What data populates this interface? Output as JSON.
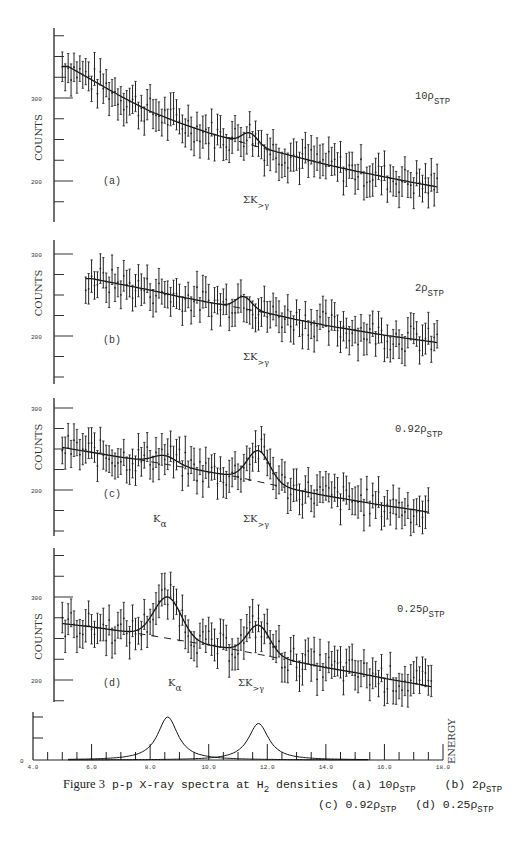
{
  "figure": {
    "caption_prefix": "Figure 3",
    "caption_title": "p-p X-ray spectra at H",
    "caption_h_sub": "2",
    "caption_rest": " densities",
    "legend_items": [
      {
        "label": "(a) 10ρ",
        "sub": "STP"
      },
      {
        "label": "(b) 2ρ",
        "sub": "STP"
      },
      {
        "label": "(c) 0.92ρ",
        "sub": "STP"
      },
      {
        "label": "(d) 0.25ρ",
        "sub": "STP"
      }
    ]
  },
  "panels": [
    {
      "id": "a",
      "tag": "(a)",
      "density": "10ρ",
      "density_sub": "STP",
      "ylabel": "COUNTS",
      "yticks": [
        "300",
        "200"
      ],
      "peak_labels": [
        "ΣK>γ"
      ]
    },
    {
      "id": "b",
      "tag": "(b)",
      "density": "2ρ",
      "density_sub": "STP",
      "ylabel": "COUNTS",
      "yticks": [
        "300",
        "200"
      ],
      "peak_labels": [
        "ΣK>γ"
      ]
    },
    {
      "id": "c",
      "tag": "(c)",
      "density": "0.92ρ",
      "density_sub": "STP",
      "ylabel": "COUNTS",
      "yticks": [
        "300",
        "200"
      ],
      "peak_labels": [
        "Kα",
        "ΣK>γ"
      ]
    },
    {
      "id": "d",
      "tag": "(d)",
      "density": "0.25ρ",
      "density_sub": "STP",
      "ylabel": "COUNTS",
      "yticks": [
        "300",
        "200"
      ],
      "peak_labels": [
        "Kα",
        "ΣK>γ"
      ]
    }
  ],
  "bottom_axis": {
    "xlabel": "ENERGY",
    "ylabel_zero": "0",
    "xticks": [
      "4.0",
      "6.0",
      "8.0",
      "10.0",
      "12.0",
      "14.0",
      "16.0",
      "18.0"
    ]
  },
  "chart_data": [
    {
      "type": "scatter",
      "title": "(a) 10ρSTP",
      "xlabel": "ENERGY (keV)",
      "ylabel": "COUNTS",
      "xlim": [
        4.0,
        18.0
      ],
      "ylim": [
        140,
        360
      ],
      "error_bars": true,
      "fit": "smooth background + Gaussian peak at ~11.7 keV (ΣK>γ); dashed background under peak",
      "series": [
        {
          "name": "background_fit",
          "x": [
            5.2,
            6,
            7,
            8,
            9,
            10,
            11,
            12,
            13,
            14,
            15,
            16,
            17,
            17.8
          ],
          "values": [
            338,
            322,
            302,
            284,
            270,
            258,
            248,
            238,
            229,
            220,
            212,
            205,
            198,
            193
          ]
        },
        {
          "name": "peak_fit",
          "x": [
            11.0,
            11.4,
            11.7,
            12.0,
            12.4
          ],
          "values": [
            248,
            258,
            265,
            258,
            238
          ]
        }
      ]
    },
    {
      "type": "scatter",
      "title": "(b) 2ρSTP",
      "xlabel": "ENERGY (keV)",
      "ylabel": "COUNTS",
      "xlim": [
        4.0,
        18.0
      ],
      "ylim": [
        140,
        310
      ],
      "error_bars": true,
      "fit": "smooth background + Gaussian peak at ~11.5 keV (ΣK>γ)",
      "series": [
        {
          "name": "background_fit",
          "x": [
            6.0,
            7,
            8,
            9,
            10,
            11,
            12,
            13,
            14,
            15,
            16,
            17,
            17.8
          ],
          "values": [
            270,
            263,
            256,
            248,
            241,
            235,
            228,
            220,
            213,
            207,
            201,
            196,
            192
          ]
        },
        {
          "name": "peak_fit",
          "x": [
            10.8,
            11.2,
            11.5,
            11.9,
            12.3
          ],
          "values": [
            236,
            248,
            252,
            240,
            226
          ]
        }
      ]
    },
    {
      "type": "scatter",
      "title": "(c) 0.92ρSTP",
      "xlabel": "ENERGY (keV)",
      "ylabel": "COUNTS",
      "xlim": [
        4.0,
        18.0
      ],
      "ylim": [
        130,
        310
      ],
      "error_bars": true,
      "fit": "background + peaks at ~8.5 keV (Kα) and ~11.7 keV (ΣK>γ)",
      "series": [
        {
          "name": "background_fit",
          "x": [
            5.0,
            6,
            7,
            8,
            9,
            10,
            11,
            12,
            13,
            14,
            15,
            16,
            17,
            17.5
          ],
          "values": [
            252,
            246,
            240,
            235,
            229,
            222,
            216,
            208,
            200,
            193,
            187,
            181,
            176,
            173
          ]
        },
        {
          "name": "peak_fit",
          "x": [
            8.0,
            8.5,
            9.0,
            11.2,
            11.7,
            12.2
          ],
          "values": [
            236,
            242,
            232,
            228,
            248,
            214
          ]
        }
      ]
    },
    {
      "type": "scatter",
      "title": "(d) 0.25ρSTP",
      "xlabel": "ENERGY (keV)",
      "ylabel": "COUNTS",
      "xlim": [
        4.0,
        18.0
      ],
      "ylim": [
        180,
        340
      ],
      "error_bars": true,
      "fit": "background + peaks at ~8.6 keV (Kα) and ~11.7 keV (ΣK>γ)",
      "series": [
        {
          "name": "background_fit",
          "x": [
            5.0,
            6,
            7,
            8,
            9,
            10,
            11,
            12,
            13,
            14,
            15,
            16,
            17,
            17.6
          ],
          "values": [
            268,
            264,
            259,
            254,
            248,
            242,
            236,
            229,
            222,
            215,
            209,
            202,
            196,
            192
          ]
        },
        {
          "name": "peak_fit",
          "x": [
            8.0,
            8.6,
            9.2,
            11.2,
            11.7,
            12.2
          ],
          "values": [
            275,
            300,
            272,
            252,
            266,
            246
          ]
        }
      ]
    },
    {
      "type": "line",
      "title": "Peak shapes",
      "xlabel": "ENERGY",
      "xlim": [
        4.0,
        18.0
      ],
      "x_ticks": [
        4.0,
        6.0,
        8.0,
        10.0,
        12.0,
        14.0,
        16.0,
        18.0
      ],
      "series": [
        {
          "name": "Kα line shape",
          "center": 8.6,
          "relative_height": 1.0
        },
        {
          "name": "ΣK>γ line shape",
          "center": 11.7,
          "relative_height": 0.85
        }
      ]
    }
  ]
}
